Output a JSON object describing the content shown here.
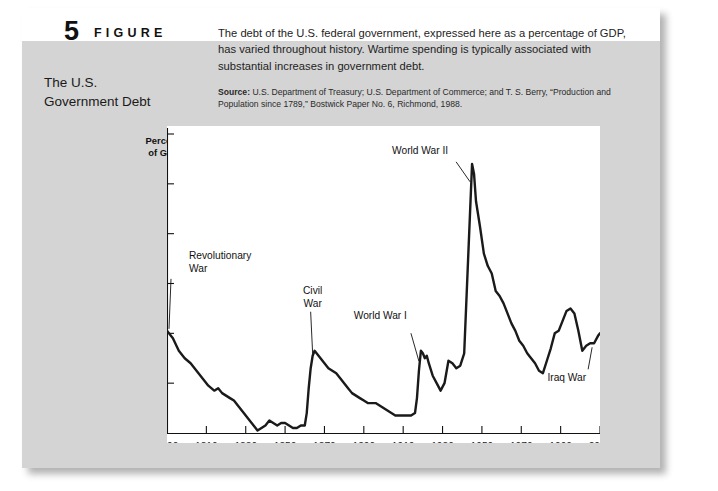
{
  "figure": {
    "number": "5",
    "word": "FIGURE",
    "title": "The U.S.\nGovernment Debt",
    "title_line1": "The U.S.",
    "title_line2": "Government Debt",
    "blurb": "The debt of the U.S. federal government, expressed here as a percentage of GDP, has varied throughout history. Wartime spending is typically associated with substantial increases in government debt.",
    "source_label": "Source:",
    "source_text": "U.S. Department of Treasury; U.S. Department of Commerce; and T. S. Berry, “Production and Population since 1789,” Bostwick Paper No. 6, Richmond, 1988."
  },
  "colors": {
    "panel_background": "#d4d4d4",
    "plot_background": "#ffffff",
    "line": "#1a1a1a",
    "text": "#111111",
    "page_background": "#ffffff"
  },
  "chart_data": {
    "type": "line",
    "title": "",
    "xlabel": "",
    "ylabel": "Percent of GDP",
    "ylabel_line1": "Percent",
    "ylabel_line2": "of GDP",
    "xlim": [
      1790,
      2010
    ],
    "ylim": [
      0,
      120
    ],
    "grid": false,
    "legend": "none",
    "xticks": [
      1790,
      1810,
      1830,
      1850,
      1870,
      1890,
      1910,
      1930,
      1950,
      1970,
      1990,
      2010
    ],
    "xticklabels": [
      "1790",
      "1810",
      "1830",
      "1850",
      "1870",
      "1890",
      "1910",
      "1930",
      "1950",
      "1970",
      "1990",
      "2010"
    ],
    "yticks": [
      0,
      20,
      40,
      60,
      80,
      100,
      120
    ],
    "yticklabels": [
      "0",
      "20",
      "40",
      "60",
      "80",
      "100",
      "120%"
    ],
    "series": [
      {
        "name": "U.S. federal debt as percent of GDP",
        "x": [
          1790,
          1793,
          1796,
          1799,
          1802,
          1805,
          1808,
          1811,
          1814,
          1816,
          1818,
          1820,
          1822,
          1824,
          1826,
          1828,
          1830,
          1832,
          1834,
          1836,
          1838,
          1840,
          1842,
          1844,
          1846,
          1848,
          1850,
          1852,
          1854,
          1856,
          1858,
          1860,
          1861,
          1862,
          1863,
          1864,
          1865,
          1866,
          1867,
          1868,
          1870,
          1872,
          1874,
          1876,
          1878,
          1880,
          1882,
          1884,
          1886,
          1888,
          1890,
          1892,
          1894,
          1896,
          1898,
          1900,
          1902,
          1904,
          1906,
          1908,
          1910,
          1912,
          1914,
          1916,
          1917,
          1918,
          1919,
          1920,
          1921,
          1922,
          1923,
          1925,
          1927,
          1929,
          1931,
          1933,
          1935,
          1937,
          1939,
          1941,
          1943,
          1945,
          1946,
          1947,
          1949,
          1951,
          1953,
          1955,
          1957,
          1959,
          1961,
          1963,
          1965,
          1967,
          1969,
          1971,
          1973,
          1975,
          1977,
          1979,
          1981,
          1983,
          1985,
          1987,
          1989,
          1991,
          1993,
          1995,
          1997,
          1999,
          2001,
          2003,
          2005,
          2007,
          2009,
          2010
        ],
        "y": [
          41,
          38,
          33,
          30,
          28,
          25,
          22,
          19,
          17,
          18,
          16,
          15,
          14,
          13,
          11,
          9,
          7,
          5,
          3,
          1,
          2,
          3,
          5,
          4,
          3,
          4,
          4,
          3,
          2,
          2,
          3,
          3,
          8,
          18,
          26,
          31,
          33,
          32,
          31,
          30,
          28,
          26,
          25,
          24,
          22,
          20,
          18,
          16,
          15,
          14,
          13,
          12,
          12,
          12,
          11,
          10,
          9,
          8,
          7,
          7,
          7,
          7,
          7,
          8,
          14,
          25,
          33,
          32,
          30,
          31,
          28,
          23,
          20,
          17,
          20,
          29,
          28,
          26,
          27,
          32,
          70,
          108,
          104,
          93,
          83,
          72,
          67,
          64,
          57,
          55,
          52,
          48,
          44,
          41,
          37,
          35,
          32,
          30,
          28,
          25,
          24,
          29,
          34,
          40,
          41,
          45,
          49,
          50,
          48,
          41,
          33,
          35,
          36,
          36,
          39,
          40
        ]
      }
    ],
    "annotations": [
      {
        "id": "revolutionary-war",
        "text": "Revolutionary\nWar",
        "line1": "Revolutionary",
        "line2": "War",
        "point_x": 1790,
        "point_y": 41
      },
      {
        "id": "civil-war",
        "text": "Civil\nWar",
        "line1": "Civil",
        "line2": "War",
        "point_x": 1864,
        "point_y": 31
      },
      {
        "id": "world-war-i",
        "text": "World War I",
        "line1": "World War I",
        "line2": "",
        "point_x": 1918,
        "point_y": 28
      },
      {
        "id": "world-war-ii",
        "text": "World War II",
        "line1": "World War II",
        "line2": "",
        "point_x": 1944,
        "point_y": 100
      },
      {
        "id": "iraq-war",
        "text": "Iraq War",
        "line1": "Iraq War",
        "line2": "",
        "point_x": 2006,
        "point_y": 36
      }
    ]
  }
}
